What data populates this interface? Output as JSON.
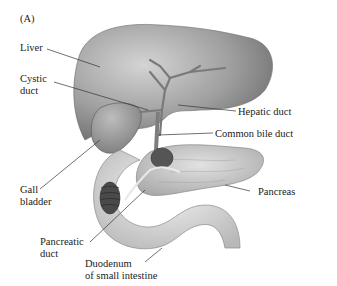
{
  "panel_label": "(A)",
  "labels": {
    "liver": "Liver",
    "cystic_duct_1": "Cystic",
    "cystic_duct_2": "duct",
    "hepatic_duct": "Hepatic duct",
    "common_bile_duct": "Common bile duct",
    "gall_bladder_1": "Gall",
    "gall_bladder_2": "bladder",
    "pancreas": "Pancreas",
    "pancreatic_duct_1": "Pancreatic",
    "pancreatic_duct_2": "duct",
    "duodenum_1": "Duodenum",
    "duodenum_2": "of small intestine"
  },
  "colors": {
    "liver": "#9a9a9a",
    "liver_highlight": "#c8c8c8",
    "duct": "#8a8a8a",
    "pancreas": "#c4c4c4",
    "duodenum": "#d8d8d8",
    "leader_line": "#333333"
  }
}
